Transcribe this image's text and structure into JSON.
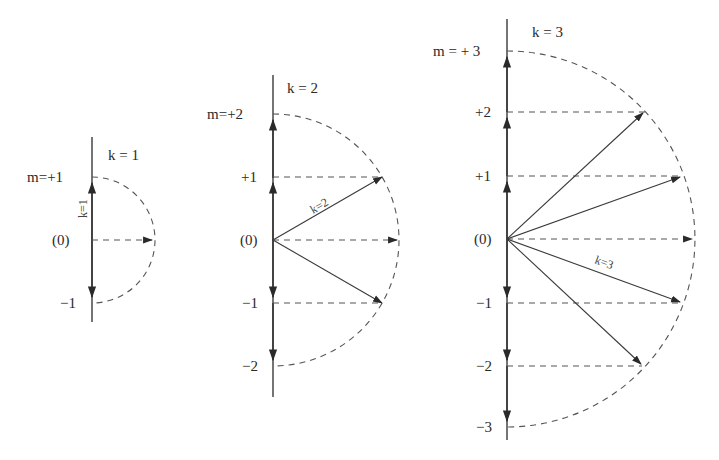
{
  "figure": {
    "diagrams": [
      {
        "k_label": "k = 1",
        "vector_label": "k=1",
        "levels": [
          {
            "m": 1,
            "label": "m=+1"
          },
          {
            "m": 0,
            "label": "(0)"
          },
          {
            "m": -1,
            "label": "−1"
          }
        ]
      },
      {
        "k_label": "k = 2",
        "vector_label": "k=2",
        "levels": [
          {
            "m": 2,
            "label": "m=+2"
          },
          {
            "m": 1,
            "label": "+1"
          },
          {
            "m": 0,
            "label": "(0)"
          },
          {
            "m": -1,
            "label": "−1"
          },
          {
            "m": -2,
            "label": "−2"
          }
        ]
      },
      {
        "k_label": "k = 3",
        "vector_label": "k=3",
        "levels": [
          {
            "m": 3,
            "label": "m = + 3"
          },
          {
            "m": 2,
            "label": "+2"
          },
          {
            "m": 1,
            "label": "+1"
          },
          {
            "m": 0,
            "label": "(0)"
          },
          {
            "m": -1,
            "label": "−1"
          },
          {
            "m": -2,
            "label": "−2"
          },
          {
            "m": -3,
            "label": "−3"
          }
        ]
      }
    ]
  }
}
